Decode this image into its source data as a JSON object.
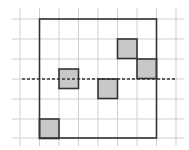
{
  "diagram": {
    "type": "grid-with-shaded-squares",
    "grid": {
      "color": "#cfcfcf",
      "vertical_lines_x": [
        20,
        39.5,
        59,
        78.5,
        98,
        117.5,
        137,
        156.5,
        176
      ],
      "horizontal_lines_y": [
        19,
        39,
        59,
        79,
        99,
        119,
        138
      ],
      "extent": {
        "x1": 12,
        "x2": 184,
        "y1": 8,
        "y2": 146
      }
    },
    "outer_square": {
      "x": 39.5,
      "y": 19,
      "width": 117,
      "height": 119,
      "stroke": "#333333"
    },
    "dashed_line": {
      "x1": 22,
      "x2": 176,
      "y": 79,
      "stroke": "#333333"
    },
    "shaded_squares": [
      {
        "x": 117.5,
        "y": 39,
        "size": 19.5
      },
      {
        "x": 137,
        "y": 59,
        "size": 19.5
      },
      {
        "x": 59,
        "y": 69,
        "size": 19.5
      },
      {
        "x": 98,
        "y": 79,
        "size": 19.5
      },
      {
        "x": 39.5,
        "y": 119,
        "size": 19.5
      }
    ],
    "fill_color": "#c8c8c8",
    "border_color": "#333333"
  }
}
